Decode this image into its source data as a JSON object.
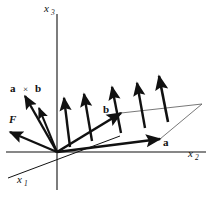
{
  "figure": {
    "background_color": "#ffffff",
    "stroke_color": "#111111",
    "thin_stroke_color": "#555555",
    "width": 210,
    "height": 198
  },
  "axes": [
    {
      "id": "x3",
      "name": "x",
      "subscript": "3",
      "label_x": 44,
      "label_y": 12,
      "direction": "up",
      "x1": 57,
      "y1": 14,
      "x2": 57,
      "y2": 190
    },
    {
      "id": "x2",
      "name": "x",
      "subscript": "2",
      "label_x": 188,
      "label_y": 157,
      "direction": "right",
      "x1": 6,
      "y1": 152,
      "x2": 206,
      "y2": 152
    },
    {
      "id": "x1",
      "name": "x",
      "subscript": "1",
      "label_x": 17,
      "label_y": 183,
      "direction": "down-left",
      "x1": 8,
      "y1": 178,
      "x2": 120,
      "y2": 136
    }
  ],
  "origin": {
    "x": 57,
    "y": 152
  },
  "vectors": [
    {
      "id": "a",
      "label": "a",
      "label_x": 163,
      "label_y": 146,
      "bold": true,
      "tail_x": 57,
      "tail_y": 152,
      "tip_x": 160,
      "tip_y": 139,
      "stroke_width": 2.6,
      "description": "vector a pointing right toward x2 axis"
    },
    {
      "id": "b",
      "label": "b",
      "label_x": 103,
      "label_y": 113,
      "bold": true,
      "tail_x": 57,
      "tail_y": 152,
      "tip_x": 121,
      "tip_y": 113,
      "stroke_width": 2.6,
      "description": "vector b pointing up-right"
    },
    {
      "id": "F",
      "label": "F",
      "label_x": 9,
      "label_y": 123,
      "italic": true,
      "tail_x": 57,
      "tail_y": 152,
      "tip_x": 10,
      "tip_y": 132,
      "stroke_width": 2.4,
      "description": "force vector F pointing down-left"
    }
  ],
  "cross_product": {
    "label_a": "a",
    "label_operator": "×",
    "label_b": "b",
    "label_a_x": 10,
    "label_b_x": 35,
    "label_op_x": 23,
    "label_y": 92,
    "description": "a cross b - family of parallel arrows normal to the a-b plane",
    "arrows": [
      {
        "id": "cross-arrow-1",
        "tail_x": 57,
        "tail_y": 152,
        "tip_x": 25,
        "tip_y": 96,
        "stroke_width": 2.4
      },
      {
        "id": "cross-arrow-2",
        "tail_x": 57,
        "tail_y": 152,
        "tip_x": 39,
        "tip_y": 108,
        "stroke_width": 2.0
      },
      {
        "id": "cross-arrow-3",
        "tail_x": 70,
        "tail_y": 147,
        "tip_x": 64,
        "tip_y": 98,
        "stroke_width": 2.4
      },
      {
        "id": "cross-arrow-4",
        "tail_x": 92,
        "tail_y": 141,
        "tip_x": 84,
        "tip_y": 94,
        "stroke_width": 2.4
      },
      {
        "id": "cross-arrow-5",
        "tail_x": 121,
        "tail_y": 133,
        "tip_x": 112,
        "tip_y": 87,
        "stroke_width": 2.4
      },
      {
        "id": "cross-arrow-6",
        "tail_x": 145,
        "tail_y": 128,
        "tip_x": 137,
        "tip_y": 83,
        "stroke_width": 2.4
      },
      {
        "id": "cross-arrow-7",
        "tail_x": 168,
        "tail_y": 122,
        "tip_x": 159,
        "tip_y": 76,
        "stroke_width": 2.6
      }
    ]
  },
  "parallelogram": {
    "description": "thin outline of the parallelogram spanned by a and b",
    "stroke_width": 0.8,
    "points": "57,152 160,139 202,104 121,113"
  }
}
